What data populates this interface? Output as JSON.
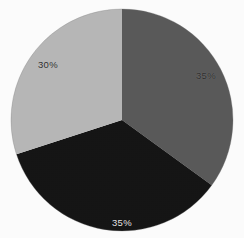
{
  "figure": {
    "background_color": "#fdfdfd",
    "width": 244,
    "height": 238
  },
  "chart_data": {
    "type": "pie",
    "title": "",
    "subtitle": "",
    "xlabel": "",
    "ylabel": "",
    "legend": false,
    "legend_position": "none",
    "grid": false,
    "categories": [
      "Segment 1",
      "Segment 2",
      "Segment 3"
    ],
    "values": [
      35,
      35,
      30
    ],
    "labels": [
      "35%",
      "35%",
      "30%"
    ],
    "colors": [
      "#5a5a5a",
      "#151515",
      "#b8b8b8"
    ],
    "start_angle_deg": 0,
    "direction": "clockwise",
    "total": 100,
    "slices": [
      {
        "label": "35%",
        "value": 35,
        "color": "#5a5a5a",
        "start_angle_deg": 0,
        "end_angle_deg": 126,
        "label_color": "#2e2e2e",
        "position": "right"
      },
      {
        "label": "35%",
        "value": 35,
        "color": "#151515",
        "start_angle_deg": 126,
        "end_angle_deg": 252,
        "label_color": "#e6e6e6",
        "position": "bottom"
      },
      {
        "label": "30%",
        "value": 30,
        "color": "#b8b8b8",
        "start_angle_deg": 252,
        "end_angle_deg": 360,
        "label_color": "#2e2e2e",
        "position": "upper-left"
      }
    ],
    "geometry": {
      "center_x": 122,
      "center_y": 120,
      "radius": 111
    }
  }
}
